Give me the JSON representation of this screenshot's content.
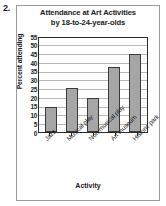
{
  "item_number": "2.",
  "chart_data": {
    "type": "bar",
    "title_line1": "Attendance at Art Activities",
    "title_line2": "by 18-to-24-year-olds",
    "title": "Attendance at Art Activities by 18-to-24-year-olds",
    "categories": [
      "Jazz",
      "Musical play",
      "Non-musical play",
      "Art museum",
      "Historic park"
    ],
    "values": [
      15,
      26,
      20,
      38.5,
      46
    ],
    "xlabel": "Activity",
    "ylabel": "Percent attending",
    "ylim": [
      0,
      55
    ],
    "ytick_step": 5,
    "yticks": [
      "55",
      "50",
      "45",
      "40",
      "35",
      "30",
      "25",
      "20",
      "15",
      "10",
      "5",
      "0"
    ],
    "grid": true,
    "legend": "none",
    "bar_color": "#a6a6a6",
    "bar_border_color": "#3a3a3a",
    "axis_color": "#2b2b2b",
    "grid_color": "#b9b9b9"
  }
}
